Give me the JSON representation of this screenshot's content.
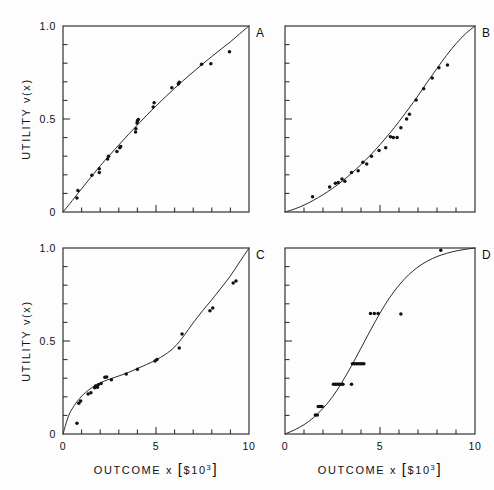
{
  "figure": {
    "panel_letters": [
      "A",
      "B",
      "C",
      "D"
    ],
    "axis": {
      "xlabel_main": "OUTCOME",
      "xlabel_var": "x",
      "xlabel_unit_open": "[",
      "xlabel_unit_dollar": "$",
      "xlabel_unit_base": "10",
      "xlabel_unit_exp": "3",
      "xlabel_unit_close": "]",
      "ylabel_main": "UTILITY",
      "ylabel_var": "v(x)",
      "xticks_labeled": [
        "0",
        "5",
        "10"
      ],
      "yticks_labeled": [
        "0",
        "0.5",
        "1.0"
      ]
    },
    "colors": {
      "ink": "#2b2b2b",
      "point": "#111111",
      "background": "#fdfdfd"
    }
  },
  "chart_data": [
    {
      "id": "A",
      "type": "scatter",
      "title": "A",
      "xlabel": "OUTCOME x [$10^3]",
      "ylabel": "UTILITY v(x)",
      "xlim": [
        0,
        10
      ],
      "ylim": [
        0,
        1
      ],
      "xticks": [
        0,
        1,
        2,
        3,
        4,
        5,
        6,
        7,
        8,
        9,
        10
      ],
      "yticks": [
        0,
        0.1,
        0.2,
        0.3,
        0.4,
        0.5,
        0.6,
        0.7,
        0.8,
        0.9,
        1.0
      ],
      "xtick_labels": {
        "0": "0",
        "5": "5",
        "10": "10"
      },
      "ytick_labels": {
        "0": "0",
        "0.5": "0.5",
        "1": "1.0"
      },
      "grid": false,
      "legend": "none",
      "shape": "concave",
      "fit_curve": {
        "description": "concave increasing utility curve through (0,0) and (10,1)",
        "x": [
          0,
          0.5,
          1,
          1.5,
          2,
          2.5,
          3,
          3.5,
          4,
          4.5,
          5,
          5.5,
          6,
          6.5,
          7,
          7.5,
          8,
          8.5,
          9,
          9.5,
          10
        ],
        "y": [
          0,
          0.062,
          0.125,
          0.187,
          0.248,
          0.305,
          0.36,
          0.415,
          0.468,
          0.52,
          0.57,
          0.618,
          0.665,
          0.71,
          0.753,
          0.795,
          0.836,
          0.876,
          0.915,
          0.958,
          1.0
        ]
      },
      "points": [
        {
          "x": 0.75,
          "y": 0.075
        },
        {
          "x": 0.8,
          "y": 0.115
        },
        {
          "x": 1.55,
          "y": 0.197
        },
        {
          "x": 1.95,
          "y": 0.213
        },
        {
          "x": 1.95,
          "y": 0.232
        },
        {
          "x": 2.4,
          "y": 0.285
        },
        {
          "x": 2.45,
          "y": 0.3
        },
        {
          "x": 2.9,
          "y": 0.325
        },
        {
          "x": 3.05,
          "y": 0.345
        },
        {
          "x": 3.1,
          "y": 0.352
        },
        {
          "x": 3.9,
          "y": 0.43
        },
        {
          "x": 3.92,
          "y": 0.448
        },
        {
          "x": 3.98,
          "y": 0.478
        },
        {
          "x": 4.0,
          "y": 0.49
        },
        {
          "x": 4.05,
          "y": 0.497
        },
        {
          "x": 4.85,
          "y": 0.565
        },
        {
          "x": 4.9,
          "y": 0.587
        },
        {
          "x": 5.85,
          "y": 0.668
        },
        {
          "x": 6.2,
          "y": 0.688
        },
        {
          "x": 6.25,
          "y": 0.697
        },
        {
          "x": 7.45,
          "y": 0.795
        },
        {
          "x": 7.95,
          "y": 0.797
        },
        {
          "x": 8.95,
          "y": 0.862
        }
      ]
    },
    {
      "id": "B",
      "type": "scatter",
      "title": "B",
      "xlabel": "OUTCOME x [$10^3]",
      "ylabel": "UTILITY v(x)",
      "xlim": [
        0,
        10
      ],
      "ylim": [
        0,
        1
      ],
      "xticks": [
        0,
        1,
        2,
        3,
        4,
        5,
        6,
        7,
        8,
        9,
        10
      ],
      "yticks": [
        0,
        0.1,
        0.2,
        0.3,
        0.4,
        0.5,
        0.6,
        0.7,
        0.8,
        0.9,
        1.0
      ],
      "xtick_labels": {
        "0": "0",
        "5": "5",
        "10": "10"
      },
      "ytick_labels": {
        "0": "0",
        "0.5": "0.5",
        "1": "1.0"
      },
      "grid": false,
      "legend": "none",
      "shape": "convex",
      "fit_curve": {
        "description": "convex increasing utility curve through (0,0) and (10,1)",
        "x": [
          0,
          0.5,
          1,
          1.5,
          2,
          2.5,
          3,
          3.5,
          4,
          4.5,
          5,
          5.5,
          6,
          6.5,
          7,
          7.5,
          8,
          8.5,
          9,
          9.5,
          10
        ],
        "y": [
          0,
          0.016,
          0.037,
          0.063,
          0.093,
          0.127,
          0.165,
          0.208,
          0.255,
          0.306,
          0.362,
          0.422,
          0.486,
          0.554,
          0.625,
          0.7,
          0.772,
          0.842,
          0.905,
          0.958,
          1.0
        ]
      },
      "points": [
        {
          "x": 1.45,
          "y": 0.082
        },
        {
          "x": 2.35,
          "y": 0.135
        },
        {
          "x": 2.65,
          "y": 0.155
        },
        {
          "x": 2.8,
          "y": 0.158
        },
        {
          "x": 3.0,
          "y": 0.178
        },
        {
          "x": 3.15,
          "y": 0.165
        },
        {
          "x": 3.5,
          "y": 0.212
        },
        {
          "x": 3.85,
          "y": 0.222
        },
        {
          "x": 4.1,
          "y": 0.268
        },
        {
          "x": 4.3,
          "y": 0.258
        },
        {
          "x": 4.55,
          "y": 0.3
        },
        {
          "x": 4.95,
          "y": 0.33
        },
        {
          "x": 5.3,
          "y": 0.345
        },
        {
          "x": 5.55,
          "y": 0.405
        },
        {
          "x": 5.7,
          "y": 0.4
        },
        {
          "x": 5.9,
          "y": 0.4
        },
        {
          "x": 6.1,
          "y": 0.453
        },
        {
          "x": 6.4,
          "y": 0.5
        },
        {
          "x": 6.55,
          "y": 0.525
        },
        {
          "x": 6.9,
          "y": 0.602
        },
        {
          "x": 7.3,
          "y": 0.663
        },
        {
          "x": 7.75,
          "y": 0.72
        },
        {
          "x": 8.1,
          "y": 0.775
        },
        {
          "x": 8.55,
          "y": 0.79
        }
      ]
    },
    {
      "id": "C",
      "type": "scatter",
      "title": "C",
      "xlabel": "OUTCOME x [$10^3]",
      "ylabel": "UTILITY v(x)",
      "xlim": [
        0,
        10
      ],
      "ylim": [
        0,
        1
      ],
      "xticks": [
        0,
        1,
        2,
        3,
        4,
        5,
        6,
        7,
        8,
        9,
        10
      ],
      "yticks": [
        0,
        0.1,
        0.2,
        0.3,
        0.4,
        0.5,
        0.6,
        0.7,
        0.8,
        0.9,
        1.0
      ],
      "xtick_labels": {
        "0": "0",
        "5": "5",
        "10": "10"
      },
      "ytick_labels": {
        "0": "0",
        "0.5": "0.5",
        "1": "1.0"
      },
      "grid": false,
      "legend": "none",
      "shape": "concave-then-convex (plateau near 0.4)",
      "fit_curve": {
        "description": "steep rise, plateau near v=0.40 for x=3..5, then steep rise to 1.0",
        "x": [
          0,
          0.3,
          0.6,
          0.9,
          1.2,
          1.6,
          2.0,
          2.5,
          3.0,
          3.5,
          4.0,
          4.5,
          5.0,
          5.5,
          6.0,
          6.5,
          7.0,
          7.5,
          8.0,
          8.5,
          9.0,
          9.5,
          10
        ],
        "y": [
          0,
          0.098,
          0.152,
          0.192,
          0.222,
          0.253,
          0.275,
          0.295,
          0.312,
          0.33,
          0.352,
          0.374,
          0.398,
          0.428,
          0.468,
          0.528,
          0.598,
          0.662,
          0.722,
          0.785,
          0.85,
          0.925,
          1.0
        ]
      },
      "points": [
        {
          "x": 0.75,
          "y": 0.058
        },
        {
          "x": 0.85,
          "y": 0.165
        },
        {
          "x": 0.95,
          "y": 0.178
        },
        {
          "x": 1.35,
          "y": 0.215
        },
        {
          "x": 1.5,
          "y": 0.222
        },
        {
          "x": 1.7,
          "y": 0.248
        },
        {
          "x": 1.75,
          "y": 0.258
        },
        {
          "x": 1.85,
          "y": 0.252
        },
        {
          "x": 1.9,
          "y": 0.265
        },
        {
          "x": 2.05,
          "y": 0.272
        },
        {
          "x": 2.25,
          "y": 0.305
        },
        {
          "x": 2.35,
          "y": 0.307
        },
        {
          "x": 2.6,
          "y": 0.292
        },
        {
          "x": 3.4,
          "y": 0.322
        },
        {
          "x": 4.0,
          "y": 0.348
        },
        {
          "x": 4.95,
          "y": 0.392
        },
        {
          "x": 5.05,
          "y": 0.4
        },
        {
          "x": 6.25,
          "y": 0.462
        },
        {
          "x": 6.4,
          "y": 0.538
        },
        {
          "x": 7.9,
          "y": 0.662
        },
        {
          "x": 8.05,
          "y": 0.678
        },
        {
          "x": 9.15,
          "y": 0.812
        },
        {
          "x": 9.3,
          "y": 0.822
        }
      ]
    },
    {
      "id": "D",
      "type": "scatter",
      "title": "D",
      "xlabel": "OUTCOME x [$10^3]",
      "ylabel": "UTILITY v(x)",
      "xlim": [
        0,
        10
      ],
      "ylim": [
        0,
        1
      ],
      "xticks": [
        0,
        1,
        2,
        3,
        4,
        5,
        6,
        7,
        8,
        9,
        10
      ],
      "yticks": [
        0,
        0.1,
        0.2,
        0.3,
        0.4,
        0.5,
        0.6,
        0.7,
        0.8,
        0.9,
        1.0
      ],
      "xtick_labels": {
        "0": "0",
        "5": "5",
        "10": "10"
      },
      "ytick_labels": {
        "0": "0",
        "0.5": "0.5",
        "1": "1.0"
      },
      "grid": false,
      "legend": "none",
      "shape": "sigmoid (S-shaped), saturating near 1.0 at x=9",
      "fit_curve": {
        "description": "S-shaped curve, inflection near x=4.3, saturates close to 1.0 by x=9",
        "x": [
          0,
          0.5,
          1.0,
          1.5,
          2.0,
          2.5,
          3.0,
          3.5,
          4.0,
          4.5,
          5.0,
          5.5,
          6.0,
          6.5,
          7.0,
          7.5,
          8.0,
          8.5,
          9.0,
          9.5,
          10
        ],
        "y": [
          0,
          0.022,
          0.05,
          0.088,
          0.138,
          0.2,
          0.278,
          0.367,
          0.462,
          0.558,
          0.65,
          0.732,
          0.8,
          0.855,
          0.898,
          0.93,
          0.954,
          0.971,
          0.984,
          0.993,
          1.0
        ]
      },
      "points": [
        {
          "x": 1.6,
          "y": 0.102
        },
        {
          "x": 1.7,
          "y": 0.102
        },
        {
          "x": 1.75,
          "y": 0.148
        },
        {
          "x": 1.85,
          "y": 0.148
        },
        {
          "x": 1.95,
          "y": 0.148
        },
        {
          "x": 2.55,
          "y": 0.268
        },
        {
          "x": 2.65,
          "y": 0.268
        },
        {
          "x": 2.75,
          "y": 0.268
        },
        {
          "x": 2.85,
          "y": 0.268
        },
        {
          "x": 2.95,
          "y": 0.268
        },
        {
          "x": 3.05,
          "y": 0.268
        },
        {
          "x": 3.5,
          "y": 0.268
        },
        {
          "x": 3.55,
          "y": 0.378
        },
        {
          "x": 3.65,
          "y": 0.378
        },
        {
          "x": 3.75,
          "y": 0.378
        },
        {
          "x": 3.85,
          "y": 0.378
        },
        {
          "x": 3.95,
          "y": 0.378
        },
        {
          "x": 4.05,
          "y": 0.378
        },
        {
          "x": 4.15,
          "y": 0.378
        },
        {
          "x": 4.5,
          "y": 0.648
        },
        {
          "x": 4.7,
          "y": 0.648
        },
        {
          "x": 4.9,
          "y": 0.648
        },
        {
          "x": 6.1,
          "y": 0.645
        },
        {
          "x": 8.2,
          "y": 0.988
        }
      ]
    }
  ]
}
